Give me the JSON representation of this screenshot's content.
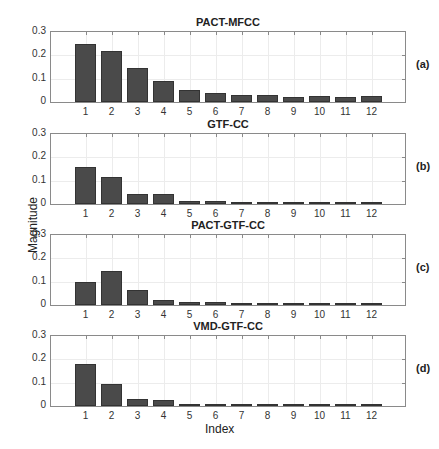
{
  "figure": {
    "ylabel": "Magnitude",
    "xlabel": "Index",
    "y_ticks": [
      "0",
      "0.1",
      "0.2",
      "0.3"
    ],
    "x_ticks": [
      "1",
      "2",
      "3",
      "4",
      "5",
      "6",
      "7",
      "8",
      "9",
      "10",
      "11",
      "12"
    ],
    "bar_color": "#4a4a4a"
  },
  "panels": [
    {
      "title": "PACT-MFCC",
      "tag": "(a)"
    },
    {
      "title": "GTF-CC",
      "tag": "(b)"
    },
    {
      "title": "PACT-GTF-CC",
      "tag": "(c)"
    },
    {
      "title": "VMD-GTF-CC",
      "tag": "(d)"
    }
  ],
  "chart_data": [
    {
      "type": "bar",
      "title": "PACT-MFCC",
      "panel_label": "(a)",
      "categories": [
        "1",
        "2",
        "3",
        "4",
        "5",
        "6",
        "7",
        "8",
        "9",
        "10",
        "11",
        "12"
      ],
      "values": [
        0.25,
        0.22,
        0.145,
        0.09,
        0.05,
        0.04,
        0.03,
        0.03,
        0.02,
        0.025,
        0.022,
        0.027
      ],
      "xlabel": "",
      "ylabel": "Magnitude",
      "ylim": [
        0,
        0.3
      ],
      "grid": true
    },
    {
      "type": "bar",
      "title": "GTF-CC",
      "panel_label": "(b)",
      "categories": [
        "1",
        "2",
        "3",
        "4",
        "5",
        "6",
        "7",
        "8",
        "9",
        "10",
        "11",
        "12"
      ],
      "values": [
        0.16,
        0.115,
        0.045,
        0.045,
        0.012,
        0.014,
        0.009,
        0.006,
        0.005,
        0.003,
        0.002,
        0.001
      ],
      "xlabel": "",
      "ylabel": "Magnitude",
      "ylim": [
        0,
        0.3
      ],
      "grid": true
    },
    {
      "type": "bar",
      "title": "PACT-GTF-CC",
      "panel_label": "(c)",
      "categories": [
        "1",
        "2",
        "3",
        "4",
        "5",
        "6",
        "7",
        "8",
        "9",
        "10",
        "11",
        "12"
      ],
      "values": [
        0.098,
        0.147,
        0.065,
        0.02,
        0.015,
        0.011,
        0.007,
        0.004,
        0.004,
        0.003,
        0.002,
        0.002
      ],
      "xlabel": "",
      "ylabel": "Magnitude",
      "ylim": [
        0,
        0.3
      ],
      "grid": true
    },
    {
      "type": "bar",
      "title": "VMD-GTF-CC",
      "panel_label": "(d)",
      "categories": [
        "1",
        "2",
        "3",
        "4",
        "5",
        "6",
        "7",
        "8",
        "9",
        "10",
        "11",
        "12"
      ],
      "values": [
        0.178,
        0.096,
        0.028,
        0.026,
        0.009,
        0.008,
        0.006,
        0.004,
        0.004,
        0.003,
        0.002,
        0.001
      ],
      "xlabel": "Index",
      "ylabel": "Magnitude",
      "ylim": [
        0,
        0.3
      ],
      "grid": true
    }
  ]
}
